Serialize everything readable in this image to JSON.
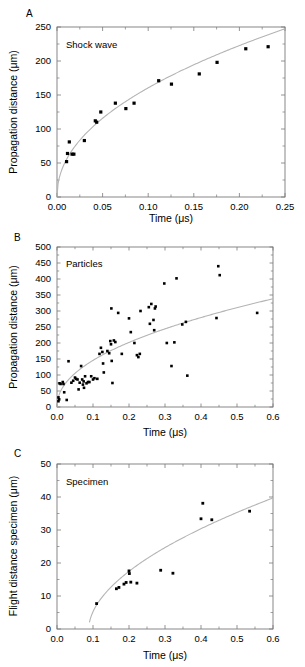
{
  "figure": {
    "background": "#ffffff",
    "marker_color": "#000000",
    "curve_color": "#b4b4b4",
    "axis_color": "#7a7a7a"
  },
  "panels": [
    {
      "letter": "A",
      "note": "Shock wave",
      "xlabel": "Time (μs)",
      "ylabel": "Propagation distance (μm)"
    },
    {
      "letter": "B",
      "note": "Particles",
      "xlabel": "Time (μs)",
      "ylabel": "Propagation distance (μm)"
    },
    {
      "letter": "C",
      "note": "Specimen",
      "xlabel": "Time (μs)",
      "ylabel": "Flight distance specimen (μm)"
    }
  ],
  "chart_data": [
    {
      "type": "scatter",
      "panel": "A",
      "title": "Shock wave",
      "xlabel": "Time (μs)",
      "ylabel": "Propagation distance (μm)",
      "xlim": [
        0.0,
        0.25
      ],
      "ylim": [
        0,
        250
      ],
      "xticks": [
        0.0,
        0.05,
        0.1,
        0.15,
        0.2,
        0.25
      ],
      "xticklabels": [
        "0.00",
        "0.05",
        "0.10",
        "0.15",
        "0.20",
        "0.25"
      ],
      "yticks": [
        0,
        50,
        100,
        150,
        200,
        250
      ],
      "yticklabels": [
        "0",
        "50",
        "100",
        "150",
        "200",
        "250"
      ],
      "x_minor_count": 1,
      "y_minor_count": 1,
      "grid": false,
      "legend": null,
      "points": [
        {
          "x": 0.0105,
          "y": 52
        },
        {
          "x": 0.0115,
          "y": 64
        },
        {
          "x": 0.0135,
          "y": 81
        },
        {
          "x": 0.0165,
          "y": 63
        },
        {
          "x": 0.0185,
          "y": 63
        },
        {
          "x": 0.03,
          "y": 83
        },
        {
          "x": 0.042,
          "y": 112
        },
        {
          "x": 0.0435,
          "y": 110
        },
        {
          "x": 0.048,
          "y": 125
        },
        {
          "x": 0.064,
          "y": 138
        },
        {
          "x": 0.0755,
          "y": 130
        },
        {
          "x": 0.0845,
          "y": 138
        },
        {
          "x": 0.1115,
          "y": 171
        },
        {
          "x": 0.1255,
          "y": 166
        },
        {
          "x": 0.156,
          "y": 181
        },
        {
          "x": 0.1755,
          "y": 198
        },
        {
          "x": 0.207,
          "y": 218
        },
        {
          "x": 0.2315,
          "y": 221
        }
      ],
      "fit": {
        "form": "power",
        "a": 476,
        "b": 0.472,
        "note": "y = a * x^b"
      }
    },
    {
      "type": "scatter",
      "panel": "B",
      "title": "Particles",
      "xlabel": "Time (μs)",
      "ylabel": "Propagation distance (μm)",
      "xlim": [
        0.0,
        0.6
      ],
      "ylim": [
        0,
        500
      ],
      "xticks": [
        0.0,
        0.1,
        0.2,
        0.3,
        0.4,
        0.5,
        0.6
      ],
      "xticklabels": [
        "0.0",
        "0.1",
        "0.2",
        "0.3",
        "0.4",
        "0.5",
        "0.6"
      ],
      "yticks": [
        0,
        50,
        100,
        150,
        200,
        250,
        300,
        350,
        400,
        450,
        500
      ],
      "yticklabels": [
        "0",
        "50",
        "100",
        "150",
        "200",
        "250",
        "300",
        "350",
        "400",
        "450",
        "500"
      ],
      "x_minor_count": 1,
      "y_minor_count": 1,
      "grid": false,
      "legend": null,
      "points": [
        {
          "x": 0.004,
          "y": 18
        },
        {
          "x": 0.004,
          "y": 30
        },
        {
          "x": 0.006,
          "y": 24
        },
        {
          "x": 0.007,
          "y": 74
        },
        {
          "x": 0.01,
          "y": 72
        },
        {
          "x": 0.016,
          "y": 78
        },
        {
          "x": 0.018,
          "y": 72
        },
        {
          "x": 0.02,
          "y": 46
        },
        {
          "x": 0.027,
          "y": 22
        },
        {
          "x": 0.032,
          "y": 143
        },
        {
          "x": 0.04,
          "y": 76
        },
        {
          "x": 0.045,
          "y": 82
        },
        {
          "x": 0.05,
          "y": 92
        },
        {
          "x": 0.053,
          "y": 88
        },
        {
          "x": 0.057,
          "y": 86
        },
        {
          "x": 0.06,
          "y": 55
        },
        {
          "x": 0.063,
          "y": 76
        },
        {
          "x": 0.067,
          "y": 128
        },
        {
          "x": 0.07,
          "y": 86
        },
        {
          "x": 0.072,
          "y": 70
        },
        {
          "x": 0.074,
          "y": 80
        },
        {
          "x": 0.075,
          "y": 60
        },
        {
          "x": 0.078,
          "y": 96
        },
        {
          "x": 0.082,
          "y": 74
        },
        {
          "x": 0.086,
          "y": 78
        },
        {
          "x": 0.09,
          "y": 78
        },
        {
          "x": 0.095,
          "y": 96
        },
        {
          "x": 0.1,
          "y": 86
        },
        {
          "x": 0.104,
          "y": 90
        },
        {
          "x": 0.112,
          "y": 88
        },
        {
          "x": 0.118,
          "y": 166
        },
        {
          "x": 0.122,
          "y": 185
        },
        {
          "x": 0.126,
          "y": 172
        },
        {
          "x": 0.128,
          "y": 136
        },
        {
          "x": 0.13,
          "y": 108
        },
        {
          "x": 0.14,
          "y": 175
        },
        {
          "x": 0.145,
          "y": 168
        },
        {
          "x": 0.148,
          "y": 206
        },
        {
          "x": 0.15,
          "y": 196
        },
        {
          "x": 0.151,
          "y": 308
        },
        {
          "x": 0.152,
          "y": 144
        },
        {
          "x": 0.154,
          "y": 75
        },
        {
          "x": 0.158,
          "y": 208
        },
        {
          "x": 0.162,
          "y": 203
        },
        {
          "x": 0.17,
          "y": 294
        },
        {
          "x": 0.18,
          "y": 166
        },
        {
          "x": 0.2,
          "y": 277
        },
        {
          "x": 0.205,
          "y": 234
        },
        {
          "x": 0.215,
          "y": 200
        },
        {
          "x": 0.222,
          "y": 162
        },
        {
          "x": 0.226,
          "y": 156
        },
        {
          "x": 0.23,
          "y": 166
        },
        {
          "x": 0.232,
          "y": 300
        },
        {
          "x": 0.255,
          "y": 312
        },
        {
          "x": 0.258,
          "y": 260
        },
        {
          "x": 0.262,
          "y": 322
        },
        {
          "x": 0.268,
          "y": 272
        },
        {
          "x": 0.27,
          "y": 240
        },
        {
          "x": 0.272,
          "y": 308
        },
        {
          "x": 0.274,
          "y": 314
        },
        {
          "x": 0.298,
          "y": 386
        },
        {
          "x": 0.305,
          "y": 200
        },
        {
          "x": 0.318,
          "y": 128
        },
        {
          "x": 0.326,
          "y": 202
        },
        {
          "x": 0.332,
          "y": 402
        },
        {
          "x": 0.348,
          "y": 258
        },
        {
          "x": 0.358,
          "y": 266
        },
        {
          "x": 0.362,
          "y": 98
        },
        {
          "x": 0.443,
          "y": 278
        },
        {
          "x": 0.448,
          "y": 440
        },
        {
          "x": 0.452,
          "y": 412
        },
        {
          "x": 0.556,
          "y": 294
        }
      ],
      "fit": {
        "form": "power",
        "a": 430,
        "b": 0.47,
        "note": "y = a * x^b"
      }
    },
    {
      "type": "scatter",
      "panel": "C",
      "title": "Specimen",
      "xlabel": "Time (μs)",
      "ylabel": "Flight distance specimen (μm)",
      "xlim": [
        0.0,
        0.6
      ],
      "ylim": [
        0,
        50
      ],
      "xticks": [
        0.0,
        0.1,
        0.2,
        0.3,
        0.4,
        0.5,
        0.6
      ],
      "xticklabels": [
        "0.0",
        "0.1",
        "0.2",
        "0.3",
        "0.4",
        "0.5",
        "0.6"
      ],
      "yticks": [
        0,
        10,
        20,
        30,
        40,
        50
      ],
      "yticklabels": [
        "0",
        "10",
        "20",
        "30",
        "40",
        "50"
      ],
      "x_minor_count": 1,
      "y_minor_count": 1,
      "grid": false,
      "legend": null,
      "points": [
        {
          "x": 0.11,
          "y": 7.7
        },
        {
          "x": 0.165,
          "y": 12.2
        },
        {
          "x": 0.172,
          "y": 12.6
        },
        {
          "x": 0.186,
          "y": 13.6
        },
        {
          "x": 0.192,
          "y": 14.1
        },
        {
          "x": 0.2,
          "y": 17.6
        },
        {
          "x": 0.201,
          "y": 16.8
        },
        {
          "x": 0.205,
          "y": 14.2
        },
        {
          "x": 0.222,
          "y": 13.9
        },
        {
          "x": 0.288,
          "y": 17.8
        },
        {
          "x": 0.322,
          "y": 16.9
        },
        {
          "x": 0.4,
          "y": 33.4
        },
        {
          "x": 0.405,
          "y": 38.1
        },
        {
          "x": 0.43,
          "y": 33.1
        },
        {
          "x": 0.535,
          "y": 35.7
        }
      ],
      "fit": {
        "form": "shifted-power",
        "x0": 0.088,
        "a": 57.0,
        "b": 0.54,
        "note": "y = a * (x - x0)^b"
      }
    }
  ]
}
